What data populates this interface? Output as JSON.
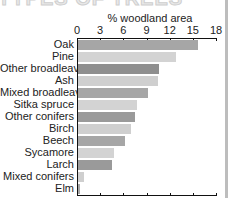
{
  "header": {
    "title": "TYPES OF TREES"
  },
  "chart_data": {
    "type": "bar",
    "orientation": "horizontal",
    "title": "",
    "xlabel": "% woodland area",
    "ylabel": "",
    "xlim": [
      0,
      18
    ],
    "xticks": [
      "0",
      "3",
      "6",
      "9",
      "12",
      "15",
      "18"
    ],
    "grid": false,
    "legend": null,
    "categories": [
      "Oak",
      "Pine",
      "Other broadleaves",
      "Ash",
      "Mixed broadleaves",
      "Sitka spruce",
      "Other conifers",
      "Birch",
      "Beech",
      "Sycamore",
      "Larch",
      "Mixed conifers",
      "Elm"
    ],
    "values": [
      15.5,
      12.7,
      10.5,
      10.3,
      9.0,
      7.6,
      7.4,
      6.9,
      6.1,
      4.6,
      4.4,
      0.8,
      0.3
    ],
    "colors": [
      "#a6a6a6",
      "#d3d3d3",
      "#8f8f8f",
      "#cfcfcf",
      "#a6a6a6",
      "#d3d3d3",
      "#9a9a9a",
      "#cfcfcf",
      "#a6a6a6",
      "#d3d3d3",
      "#9a9a9a",
      "#cfcfcf",
      "#a6a6a6"
    ]
  }
}
